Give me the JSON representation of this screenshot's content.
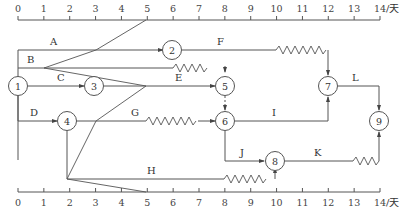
{
  "diagram": {
    "type": "time-scaled network (double-code) with check line",
    "scale": {
      "ticks": [
        "0",
        "1",
        "2",
        "3",
        "4",
        "5",
        "6",
        "7",
        "8",
        "9",
        "10",
        "11",
        "12",
        "13",
        "14"
      ],
      "unit": "/天"
    },
    "nodes": [
      {
        "id": "1",
        "label": "1"
      },
      {
        "id": "2",
        "label": "2"
      },
      {
        "id": "3",
        "label": "3"
      },
      {
        "id": "4",
        "label": "4"
      },
      {
        "id": "5",
        "label": "5"
      },
      {
        "id": "6",
        "label": "6"
      },
      {
        "id": "7",
        "label": "7"
      },
      {
        "id": "8",
        "label": "8"
      },
      {
        "id": "9",
        "label": "9"
      }
    ],
    "activities": [
      {
        "label": "A",
        "from": "1",
        "to": "2",
        "start": 0,
        "end": 6
      },
      {
        "label": "B",
        "from": "1",
        "to": "5",
        "start": 0,
        "end": 6,
        "free_float_to": 8
      },
      {
        "label": "C",
        "from": "1",
        "to": "3",
        "start": 0,
        "end": 3
      },
      {
        "label": "D",
        "from": "1",
        "to": "4",
        "start": 0,
        "end": 2
      },
      {
        "label": "E",
        "from": "3",
        "to": "5",
        "start": 3,
        "end": 8
      },
      {
        "label": "F",
        "from": "2",
        "to": "7",
        "start": 6,
        "end": 10,
        "free_float_to": 12
      },
      {
        "label": "G",
        "from": "4",
        "to": "6",
        "start": 2,
        "end": 5,
        "free_float_to": 8
      },
      {
        "label": "H",
        "from": "4",
        "to": "8",
        "start": 2,
        "end": 8,
        "free_float_to": 10
      },
      {
        "label": "I",
        "from": "6",
        "to": "7",
        "start": 8,
        "end": 12
      },
      {
        "label": "J",
        "from": "6",
        "to": "8",
        "start": 8,
        "end": 10
      },
      {
        "label": "K",
        "from": "8",
        "to": "9",
        "start": 10,
        "end": 13,
        "free_float_to": 14
      },
      {
        "label": "L",
        "from": "7",
        "to": "9",
        "start": 12,
        "end": 14
      }
    ],
    "check_line": {
      "at_day": 5,
      "points_day": [
        5,
        3,
        1.5,
        5,
        3,
        2,
        5
      ]
    }
  }
}
